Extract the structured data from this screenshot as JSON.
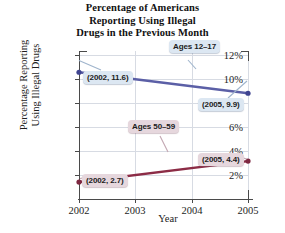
{
  "chart_data": {
    "type": "line",
    "title": "Percentage of Americans Reporting Using Illegal Drugs in the Previous Month",
    "title_lines": [
      "Percentage of Americans",
      "Reporting Using Illegal",
      "Drugs in the Previous Month"
    ],
    "xlabel": "Year",
    "ylabel": "Percentage Reporting Using Illegal Drugs",
    "ylabel_lines": [
      "Percentage Reporting",
      "Using Illegal Drugs"
    ],
    "x": [
      2002,
      2003,
      2004,
      2005
    ],
    "xtick_labels": [
      "2002",
      "2003",
      "2004",
      "2005"
    ],
    "xlim": [
      2002,
      2005
    ],
    "ylim": [
      1,
      13
    ],
    "ytick_values": [
      2,
      4,
      6,
      8,
      10,
      12
    ],
    "ytick_labels": [
      "2%",
      "4%",
      "6%",
      "8%",
      "10%",
      "12%"
    ],
    "grid": "both-light",
    "legend": "inline-annotations",
    "series": [
      {
        "name": "Ages 12–17",
        "color": "#5b5fa6",
        "marker_color": "#3f4490",
        "points": [
          {
            "x": 2002,
            "y": 11.6,
            "label": "(2002, 11.6)"
          },
          {
            "x": 2005,
            "y": 9.9,
            "label": "(2005, 9.9)"
          }
        ]
      },
      {
        "name": "Ages 50–59",
        "color": "#8c2c46",
        "marker_color": "#7d2740",
        "points": [
          {
            "x": 2002,
            "y": 2.7,
            "label": "(2002, 2.7)"
          },
          {
            "x": 2005,
            "y": 4.4,
            "label": "(2005, 4.4)"
          }
        ]
      }
    ],
    "annotations": [
      {
        "id": "series-label-teens",
        "text": "Ages 12–17",
        "style": "blue"
      },
      {
        "id": "series-label-fifties",
        "text": "Ages 50–59",
        "style": "red"
      },
      {
        "id": "point-label-2002-teens",
        "text": "(2002, 11.6)",
        "style": "blue"
      },
      {
        "id": "point-label-2005-teens",
        "text": "(2005, 9.9)",
        "style": "blue"
      },
      {
        "id": "point-label-2002-fifties",
        "text": "(2002, 2.7)",
        "style": "red"
      },
      {
        "id": "point-label-2005-fifties",
        "text": "(2005, 4.4)",
        "style": "red"
      }
    ],
    "colors": {
      "series_blue": "#5b5fa6",
      "series_red": "#8c2c46",
      "callout_blue_bg": "#dce7f2",
      "callout_red_bg": "#e6d7dd",
      "axis": "#4a4a4a",
      "grid": "#d7dbe3",
      "background": "#ffffff"
    }
  }
}
